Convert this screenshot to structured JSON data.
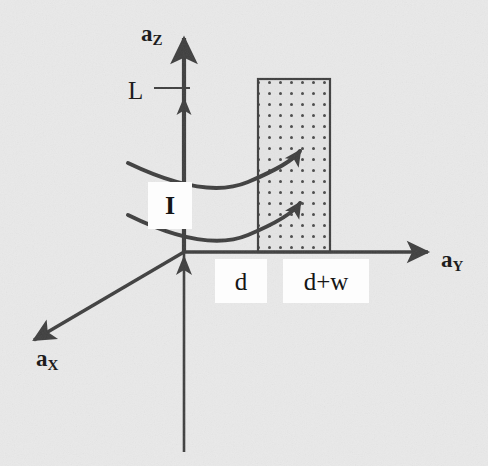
{
  "figure": {
    "background_color": "#e9e9e9",
    "ink_color": "#3f3f3f",
    "text_color": "#1d1d1d",
    "width": 488,
    "height": 466
  },
  "axes": [
    {
      "id": "z",
      "label_base": "a",
      "label_sub": "Z",
      "direction": "up",
      "arrow_tip": [
        184,
        30
      ],
      "origin": [
        184,
        252
      ]
    },
    {
      "id": "y",
      "label_base": "a",
      "label_sub": "Y",
      "direction": "right",
      "arrow_tip": [
        437,
        252
      ],
      "origin": [
        184,
        252
      ]
    },
    {
      "id": "x",
      "label_base": "a",
      "label_sub": "X",
      "direction": "lower-left",
      "arrow_tip": [
        26,
        345
      ],
      "origin": [
        184,
        252
      ]
    }
  ],
  "tick_marks": [
    {
      "name": "L",
      "label": "L",
      "axis": "z",
      "y": 88,
      "tick_from_x": 154,
      "tick_to_x": 190
    }
  ],
  "region": {
    "name": "dotted-slab",
    "fill_pattern": "dot-grid",
    "x": 258,
    "y": 79,
    "width": 72,
    "height": 173,
    "dot_spacing": 11,
    "dot_color": "#4a4a4a",
    "border_color": "#3f3f3f"
  },
  "current_arrows": [
    {
      "name": "upper-current-arc",
      "start": [
        128,
        163
      ],
      "control": [
        232,
        196
      ],
      "end": [
        300,
        150
      ]
    },
    {
      "name": "lower-current-arc",
      "start": [
        128,
        215
      ],
      "control": [
        232,
        250
      ],
      "end": [
        300,
        202
      ]
    }
  ],
  "labels": {
    "current": "I",
    "length": "L",
    "near_edge": "d",
    "far_edge": "d+w",
    "axis_z": "a",
    "axis_z_sub": "Z",
    "axis_y": "a",
    "axis_y_sub": "Y",
    "axis_x": "a",
    "axis_x_sub": "X"
  }
}
